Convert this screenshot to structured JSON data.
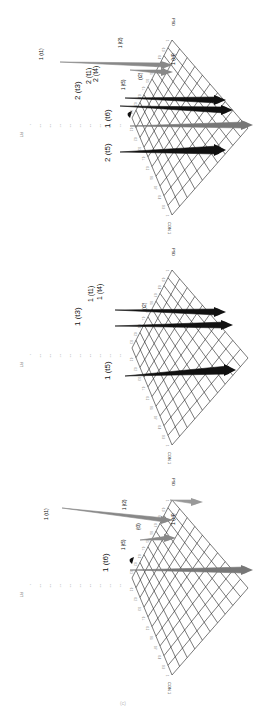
{
  "figure": {
    "orientation": "rotated-90-clockwise",
    "panel_count": 3,
    "axis_labels": {
      "vertical": "FIT",
      "left": "CON",
      "right": "PSD"
    },
    "ticks": [
      "0.1",
      "0.2",
      "0.3",
      "0.4",
      "0.5",
      "0.6",
      "0.7",
      "0.8",
      "0.9",
      "1"
    ],
    "fit_ticks": [
      "0.1",
      "0.2",
      "0.3",
      "0.4",
      "0.5",
      "0.6",
      "0.7",
      "0.8",
      "0.9",
      "1"
    ],
    "caption_fragment": "(c)"
  },
  "chart_data": [
    {
      "type": "surface-3d",
      "panel": "top",
      "axes": {
        "x": "CON",
        "y": "PSD",
        "z": "FIT"
      },
      "xlim": [
        0,
        1
      ],
      "ylim": [
        0,
        1
      ],
      "zlim": [
        0,
        1
      ],
      "grid": true,
      "color": "#111111",
      "peaks": [
        {
          "label": "2 (t1)",
          "style": "dark"
        },
        {
          "label": "2 (t2)",
          "style": "dark"
        },
        {
          "label": "2 (t3)",
          "style": "dark"
        },
        {
          "label": "2 (t4)",
          "style": "dark"
        },
        {
          "label": "2 (t5)",
          "style": "dark"
        },
        {
          "label": "1 (t6)",
          "style": "gray"
        },
        {
          "label": "1 (t1)",
          "style": "gray"
        },
        {
          "label": "1 (t2)",
          "style": "gray"
        },
        {
          "label": "1 (t4)",
          "style": "gray"
        },
        {
          "label": "1 (t5)",
          "style": "gray"
        }
      ]
    },
    {
      "type": "surface-3d",
      "panel": "middle",
      "axes": {
        "x": "CON",
        "y": "PSD",
        "z": "FIT"
      },
      "xlim": [
        0,
        1
      ],
      "ylim": [
        0,
        1
      ],
      "zlim": [
        0,
        1
      ],
      "grid": true,
      "peaks": [
        {
          "label": "1 (t1)",
          "style": "dark"
        },
        {
          "label": "1 (t2)",
          "style": "dark"
        },
        {
          "label": "1 (t3)",
          "style": "dark"
        },
        {
          "label": "1 (t4)",
          "style": "dark"
        },
        {
          "label": "1 (t5)",
          "style": "dark"
        }
      ]
    },
    {
      "type": "surface-3d",
      "panel": "bottom",
      "axes": {
        "x": "CON",
        "y": "PSD",
        "z": "FIT"
      },
      "xlim": [
        0,
        1
      ],
      "ylim": [
        0,
        1
      ],
      "zlim": [
        0,
        1
      ],
      "grid": true,
      "peaks": [
        {
          "label": "1 (t1)",
          "style": "gray"
        },
        {
          "label": "1 (t2)",
          "style": "gray"
        },
        {
          "label": "1 (t3)",
          "style": "gray"
        },
        {
          "label": "1 (t4)",
          "style": "gray"
        },
        {
          "label": "1 (t5)",
          "style": "gray"
        },
        {
          "label": "1 (t6)",
          "style": "dark"
        }
      ]
    }
  ],
  "panels": [
    {
      "offset": 0,
      "labels": [
        {
          "text": "1 (t1)",
          "x": 43,
          "y": 60,
          "size": 5
        },
        {
          "text": "1 (t2)",
          "x": 122,
          "y": 48,
          "size": 4.5
        },
        {
          "text": "2 (t3)",
          "x": 80,
          "y": 100,
          "size": 8
        },
        {
          "text": "2 (t1)",
          "x": 91,
          "y": 84,
          "size": 7
        },
        {
          "text": "2 (t4)",
          "x": 98,
          "y": 82,
          "size": 7
        },
        {
          "text": "1 (t5)",
          "x": 125,
          "y": 90,
          "size": 4.5
        },
        {
          "text": "(t2)",
          "x": 142,
          "y": 80,
          "size": 5
        },
        {
          "text": "1 (t4)",
          "x": 175,
          "y": 65,
          "size": 5
        },
        {
          "text": "1 (t6)",
          "x": 110,
          "y": 128,
          "size": 8
        },
        {
          "text": "2 (t5)",
          "x": 110,
          "y": 162,
          "size": 8
        }
      ]
    },
    {
      "offset": 230,
      "labels": [
        {
          "text": "1 (t3)",
          "x": 80,
          "y": 96,
          "size": 8
        },
        {
          "text": "1 (t1)",
          "x": 93,
          "y": 72,
          "size": 7
        },
        {
          "text": "1 (t4)",
          "x": 102,
          "y": 70,
          "size": 7
        },
        {
          "text": "(t2)",
          "x": 146,
          "y": 80,
          "size": 5
        },
        {
          "text": "1 (t5)",
          "x": 110,
          "y": 150,
          "size": 8
        }
      ]
    },
    {
      "offset": 460,
      "labels": [
        {
          "text": "1 (t1)",
          "x": 48,
          "y": 60,
          "size": 5
        },
        {
          "text": "1 (t2)",
          "x": 126,
          "y": 50,
          "size": 4.5
        },
        {
          "text": "1 (t5)",
          "x": 125,
          "y": 90,
          "size": 4.5
        },
        {
          "text": "(t3)",
          "x": 140,
          "y": 70,
          "size": 4.5
        },
        {
          "text": "1 (t4)",
          "x": 175,
          "y": 65,
          "size": 5
        },
        {
          "text": "1 (t6)",
          "x": 108,
          "y": 112,
          "size": 8
        }
      ]
    }
  ]
}
